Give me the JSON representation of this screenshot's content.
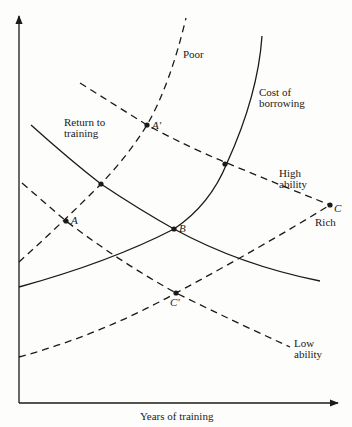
{
  "diagram": {
    "x_axis_label": "Years of training",
    "y_axis_label": "",
    "colors": {
      "ink": "#1a1a1a",
      "background": "#fdfdfb"
    },
    "curves": [
      {
        "id": "poor",
        "label": "Poor",
        "style": "dashed",
        "type": "cost of borrowing (poor)"
      },
      {
        "id": "cost",
        "label_line1": "Cost of",
        "label_line2": "borrowing",
        "style": "solid"
      },
      {
        "id": "rich",
        "label": "Rich",
        "style": "dashed"
      },
      {
        "id": "return",
        "label_line1": "Return to",
        "label_line2": "training",
        "style": "solid"
      },
      {
        "id": "high",
        "label_line1": "High",
        "label_line2": "ability",
        "style": "dashed"
      },
      {
        "id": "low",
        "label_line1": "Low",
        "label_line2": "ability",
        "style": "dashed"
      }
    ],
    "points": [
      {
        "name": "A",
        "label": "A"
      },
      {
        "name": "A'",
        "label": "A'"
      },
      {
        "name": "B",
        "label": "B"
      },
      {
        "name": "C",
        "label": "C"
      },
      {
        "name": "C'",
        "label": "C'"
      }
    ]
  }
}
